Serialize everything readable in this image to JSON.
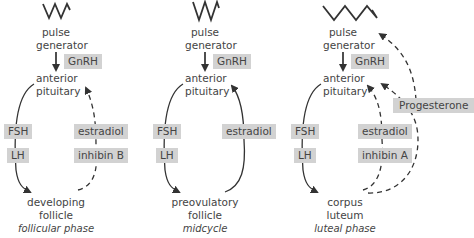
{
  "panels": [
    {
      "id": "follicular",
      "pulse_generator": "pulse\ngenerator",
      "pulse_line1": "pulse",
      "pulse_line2": "generator",
      "gnrh": "GnRH",
      "pituitary_line1": "anterior",
      "pituitary_line2": "pituitary",
      "fsh": "FSH",
      "lh": "LH",
      "feedback": [
        "estradiol",
        "inhibin B"
      ],
      "target_line1": "developing",
      "target_line2": "follicle",
      "phase": "follicular phase"
    },
    {
      "id": "midcycle",
      "pulse_line1": "pulse",
      "pulse_line2": "generator",
      "gnrh": "GnRH",
      "pituitary_line1": "anterior",
      "pituitary_line2": "pituitary",
      "fsh": "FSH",
      "lh": "LH",
      "feedback": [
        "estradiol"
      ],
      "target_line1": "preovulatory",
      "target_line2": "follicle",
      "phase": "midcycle"
    },
    {
      "id": "luteal",
      "pulse_line1": "pulse",
      "pulse_line2": "generator",
      "gnrh": "GnRH",
      "pituitary_line1": "anterior",
      "pituitary_line2": "pituitary",
      "fsh": "FSH",
      "lh": "LH",
      "feedback": [
        "estradiol",
        "inhibin A"
      ],
      "progesterone": "Progesterone",
      "target_line1": "corpus",
      "target_line2": "luteum",
      "phase": "luteal phase"
    }
  ],
  "colors": {
    "box_fill": "#d2d2d2",
    "line": "#333333",
    "text": "#444444"
  }
}
